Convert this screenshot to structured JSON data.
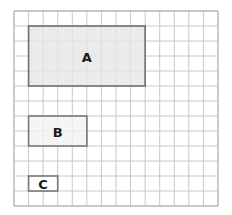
{
  "grid": {
    "columns": 14,
    "rows": 13,
    "origin_x": 14,
    "origin_y": 11,
    "cell_w": 14.57,
    "cell_h": 15,
    "line_color": "#c8c8c8",
    "border_color": "#b4b4b4"
  },
  "rectangles": [
    {
      "label": "A",
      "col": 1,
      "row": 1,
      "width_cells": 8,
      "height_cells": 4,
      "fill": "#e6e6e6",
      "stroke": "#6e6e6e"
    },
    {
      "label": "B",
      "col": 1,
      "row": 7,
      "width_cells": 4,
      "height_cells": 2,
      "fill": "#f2f2f2",
      "stroke": "#777777"
    },
    {
      "label": "C",
      "col": 1,
      "row": 11,
      "width_cells": 2,
      "height_cells": 1,
      "fill": "#ffffff",
      "stroke": "#777777"
    }
  ]
}
